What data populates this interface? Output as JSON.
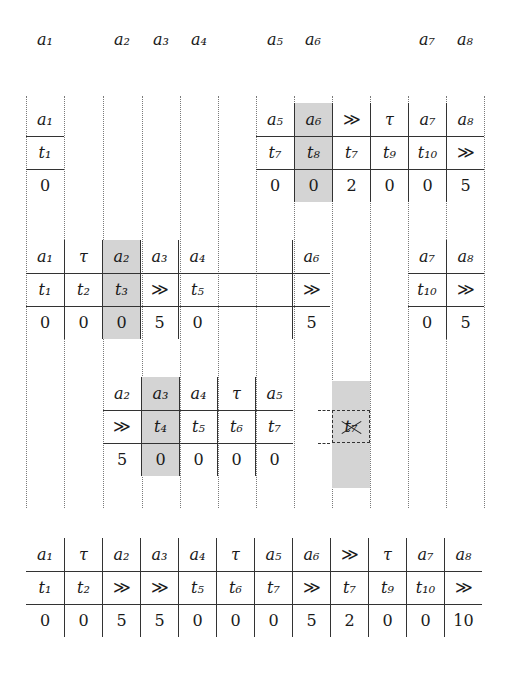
{
  "figure": {
    "symbols": {
      "shift": "≫",
      "tau": "τ"
    },
    "colors": {
      "highlight": "#d4d4d4",
      "rule": "#333333",
      "guide": "#7a7a7a",
      "background": "#ffffff"
    }
  },
  "column_guides": [
    26,
    64,
    103,
    142,
    180,
    218,
    256,
    294,
    332,
    370,
    408,
    446,
    484
  ],
  "top_labels": [
    {
      "text": "a₁",
      "base": "a",
      "sub": "1",
      "x": 26
    },
    {
      "text": "a₂",
      "base": "a",
      "sub": "2",
      "x": 103
    },
    {
      "text": "a₃",
      "base": "a",
      "sub": "3",
      "x": 142
    },
    {
      "text": "a₄",
      "base": "a",
      "sub": "4",
      "x": 180
    },
    {
      "text": "a₅",
      "base": "a",
      "sub": "5",
      "x": 256
    },
    {
      "text": "a₆",
      "base": "a",
      "sub": "6",
      "x": 294
    },
    {
      "text": "a₇",
      "base": "a",
      "sub": "7",
      "x": 408
    },
    {
      "text": "a₈",
      "base": "a",
      "sub": "8",
      "x": 446
    }
  ],
  "blocks": [
    {
      "name": "block-1",
      "y": 103,
      "segments": [
        {
          "x": 26,
          "cols": 1,
          "highlight": [],
          "rows": {
            "align": [
              "a₁"
            ],
            "token": [
              "t₁"
            ],
            "value": [
              "0"
            ]
          }
        },
        {
          "x": 256,
          "cols": 6,
          "highlight": [
            1
          ],
          "rows": {
            "align": [
              "a₅",
              "a₆",
              "≫",
              "τ",
              "a₇",
              "a₈"
            ],
            "token": [
              "t₇",
              "t₈",
              "t₇",
              "t₉",
              "t₁₀",
              "≫"
            ],
            "value": [
              "0",
              "0",
              "2",
              "0",
              "0",
              "5"
            ]
          }
        }
      ]
    },
    {
      "name": "block-2",
      "y": 240,
      "segments": [
        {
          "x": 26,
          "cols": 8,
          "highlight": [
            2
          ],
          "rows": {
            "align": [
              "a₁",
              "τ",
              "a₂",
              "a₃",
              "a₄",
              "",
              "",
              "a₆"
            ],
            "token": [
              "t₁",
              "t₂",
              "t₃",
              "≫",
              "t₅",
              "",
              "",
              "≫"
            ],
            "value": [
              "0",
              "0",
              "0",
              "5",
              "0",
              "",
              "",
              "5"
            ]
          }
        },
        {
          "x": 408,
          "cols": 2,
          "highlight": [],
          "rows": {
            "align": [
              "a₇",
              "a₈"
            ],
            "token": [
              "t₁₀",
              "≫"
            ],
            "value": [
              "0",
              "5"
            ]
          }
        }
      ]
    },
    {
      "name": "block-3",
      "y": 377,
      "segments": [
        {
          "x": 103,
          "cols": 5,
          "highlight": [
            1
          ],
          "rows": {
            "align": [
              "a₂",
              "a₃",
              "a₄",
              "τ",
              "a₅"
            ],
            "token": [
              "≫",
              "t₄",
              "t₅",
              "t₆",
              "t₇"
            ],
            "value": [
              "5",
              "0",
              "0",
              "0",
              "0"
            ]
          }
        }
      ],
      "removed_token": {
        "label": "t₇",
        "x": 332,
        "y": 410,
        "width": 38,
        "height": 33,
        "struck": true
      },
      "removed_shade": {
        "x": 332,
        "y": 381,
        "width": 38,
        "height": 107
      }
    }
  ],
  "summary_table": {
    "name": "summary-table",
    "x": 26,
    "y": 538,
    "cols": 12,
    "rows": {
      "align": [
        "a₁",
        "τ",
        "a₂",
        "a₃",
        "a₄",
        "τ",
        "a₅",
        "a₆",
        "≫",
        "τ",
        "a₇",
        "a₈"
      ],
      "token": [
        "t₁",
        "t₂",
        "≫",
        "≫",
        "t₅",
        "t₆",
        "t₇",
        "≫",
        "t₇",
        "t₉",
        "t₁₀",
        "≫"
      ],
      "value": [
        "0",
        "0",
        "5",
        "5",
        "0",
        "0",
        "0",
        "5",
        "2",
        "0",
        "0",
        "10"
      ]
    }
  }
}
